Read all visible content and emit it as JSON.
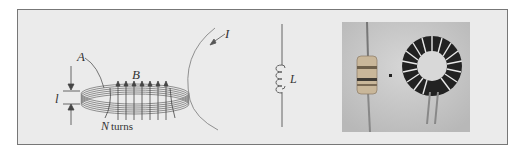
{
  "figure": {
    "panels": [
      {
        "name": "toroidal-coil-diagram",
        "labels": {
          "current": "I",
          "area": "A",
          "field": "B",
          "length": "l",
          "turns_var": "N",
          "turns_word": "turns"
        }
      },
      {
        "name": "inductor-symbol",
        "labels": {
          "inductance": "L"
        }
      },
      {
        "name": "inductor-photo",
        "description": "Photo of an axial inductor and a toroidal inductor"
      }
    ]
  },
  "colors": {
    "frame_bg": "#ebebeb",
    "frame_border": "#777777",
    "line": "#555555",
    "photo_bg": "#c9c9c9"
  }
}
